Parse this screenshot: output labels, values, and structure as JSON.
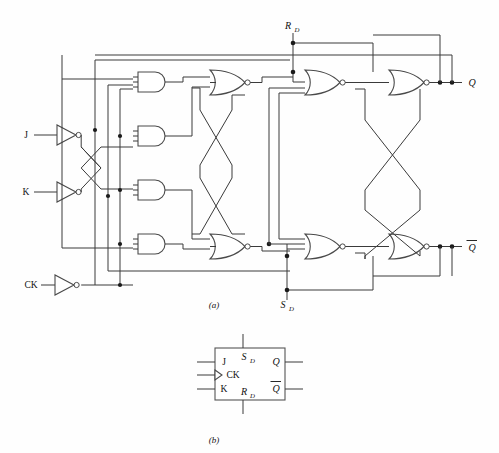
{
  "figure": {
    "panels": [
      {
        "id": "a",
        "caption": "(a)",
        "caption_x": 214,
        "caption_y": 305,
        "description": "gate-level schematic"
      },
      {
        "id": "b",
        "caption": "(b)",
        "caption_x": 214,
        "caption_y": 440,
        "description": "block symbol"
      }
    ]
  },
  "schematic": {
    "inputs": [
      {
        "name": "J",
        "label": "J",
        "x": 26,
        "y": 135,
        "inverted": true
      },
      {
        "name": "K",
        "label": "K",
        "x": 26,
        "y": 192,
        "inverted": true
      },
      {
        "name": "CK",
        "label": "CK",
        "x": 20,
        "y": 285,
        "inverted": true
      }
    ],
    "direct_inputs": [
      {
        "name": "RD",
        "label": "R",
        "sub": "D",
        "x": 288,
        "y": 26,
        "side": "top"
      },
      {
        "name": "SD",
        "label": "S",
        "sub": "D",
        "x": 283,
        "y": 306,
        "side": "bottom"
      }
    ],
    "outputs": [
      {
        "name": "Q",
        "label": "Q",
        "x": 472,
        "y": 81,
        "overbar": false
      },
      {
        "name": "QB",
        "label": "Q",
        "x": 472,
        "y": 248,
        "overbar": true
      }
    ],
    "and_gates": [
      {
        "id": "A1",
        "inputs": 3,
        "x": 138,
        "y": 72
      },
      {
        "id": "A2",
        "inputs": 3,
        "x": 138,
        "y": 126
      },
      {
        "id": "A3",
        "inputs": 3,
        "x": 138,
        "y": 180
      },
      {
        "id": "A4",
        "inputs": 3,
        "x": 138,
        "y": 234
      }
    ],
    "nor_gates": [
      {
        "id": "N1",
        "inputs": 3,
        "x": 212,
        "y": 70,
        "stage": "master"
      },
      {
        "id": "N2",
        "inputs": 3,
        "x": 212,
        "y": 234,
        "stage": "master"
      },
      {
        "id": "N3",
        "inputs": 3,
        "x": 308,
        "y": 70,
        "stage": "slave-in"
      },
      {
        "id": "N4",
        "inputs": 3,
        "x": 308,
        "y": 234,
        "stage": "slave-in"
      },
      {
        "id": "N5",
        "inputs": 2,
        "x": 392,
        "y": 70,
        "stage": "slave-out"
      },
      {
        "id": "N6",
        "inputs": 2,
        "x": 392,
        "y": 234,
        "stage": "slave-out"
      }
    ],
    "gate_counts": {
      "and": 4,
      "nor": 6,
      "inverter": 3
    }
  },
  "symbol": {
    "box": {
      "x": 215,
      "y": 348,
      "w": 70,
      "h": 52
    },
    "pins_left": [
      {
        "name": "J",
        "label": "J",
        "y": 362,
        "clock": false
      },
      {
        "name": "CK",
        "label": "CK",
        "y": 374,
        "clock": true
      },
      {
        "name": "K",
        "label": "K",
        "y": 389,
        "clock": false
      }
    ],
    "pins_top": [
      {
        "name": "SD",
        "label": "S",
        "sub": "D"
      }
    ],
    "pins_bottom": [
      {
        "name": "RD",
        "label": "R",
        "sub": "D"
      }
    ],
    "pins_right": [
      {
        "name": "Q",
        "label": "Q",
        "y": 362,
        "overbar": false
      },
      {
        "name": "QB",
        "label": "Q",
        "y": 389,
        "overbar": true
      }
    ]
  },
  "colors": {
    "background": "#ffffff",
    "wire": "#3a3a3a",
    "gate_stroke": "#4a4a4a",
    "gate_fill": "#ffffff",
    "junction_dot": "#1a1a1a",
    "text": "#111111"
  }
}
